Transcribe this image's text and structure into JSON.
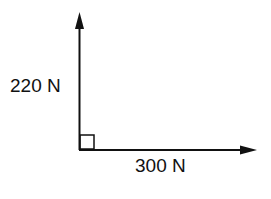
{
  "diagram": {
    "type": "force vectors",
    "vectors": [
      {
        "name": "vertical-force",
        "label": "220 N",
        "direction": "up"
      },
      {
        "name": "horizontal-force",
        "label": "300 N",
        "direction": "right"
      }
    ],
    "angle_marker": "right-angle",
    "colors": {
      "stroke": "#111111",
      "background": "#ffffff"
    }
  }
}
